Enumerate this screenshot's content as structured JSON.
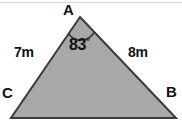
{
  "figure": {
    "kind": "triangle-diagram",
    "background_color": "#ffffff",
    "fill_color": "#a8a8a8",
    "stroke_color": "#3a3a3a",
    "text_color": "#111111",
    "vertices": {
      "a": {
        "label": "A",
        "x": 80,
        "y": 17
      },
      "b": {
        "label": "B",
        "x": 176,
        "y": 118
      },
      "c": {
        "label": "C",
        "x": 11,
        "y": 118
      }
    },
    "sides": {
      "ca": {
        "label": "7m",
        "value": 7,
        "unit": "m"
      },
      "ab": {
        "label": "8m",
        "value": 8,
        "unit": "m"
      }
    },
    "angle_a": {
      "value": "83",
      "degree_symbol": "°",
      "full_label": "83°"
    }
  }
}
